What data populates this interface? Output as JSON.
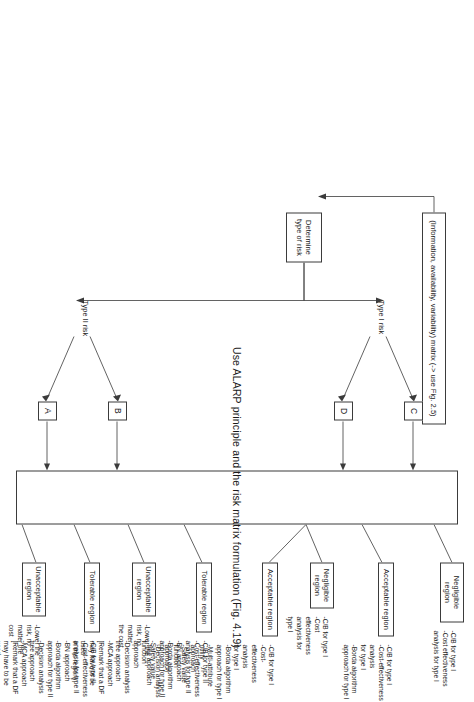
{
  "figure": {
    "caption_left": "",
    "orientation": "rotated-90"
  },
  "diagram": {
    "title": "Use ALARP principle and the risk matrix formulation (Fig. 4.19)",
    "top_input": "(Information, availability, variability) matrix (-> use Fig. 2.5)",
    "determine": "Determine\ntype of risk",
    "branch_labels": {
      "type1": "Type I risk",
      "type2": "Type II risk"
    },
    "nodes": [
      {
        "id": "A",
        "label": "A"
      },
      {
        "id": "B",
        "label": "B"
      },
      {
        "id": "C",
        "label": "C"
      },
      {
        "id": "D",
        "label": "D"
      }
    ],
    "regions": [
      {
        "key": "unacceptable-2",
        "header": "Unacceptable\nregion",
        "items": "-Lower the\nrisk, no\nmatter the\ncost"
      },
      {
        "key": "tolerable-2",
        "header": "Tolerable region",
        "items": "-C/B for type II\n-Cost-effectiveness\nanalysis for type II\n-BN approach\n-Borda algorithm\napproach for type II\n-Decision analysis\ntree approach\n-MCA approach\n[Remark that a DF\nmay have to be used\nin this region]"
      },
      {
        "key": "unacceptable-1",
        "header": "Unacceptable\nregion",
        "items": "-Lower the\nrisk, no\nmatter\nthe cost"
      },
      {
        "key": "tolerable-1",
        "header": "Tolerable region",
        "items": "-C/B for type II\n-Cost-effectiveness\nanalysis for type II\n-BN approach\n-Borda algorithm\napproach for type II\n-Safety value function\napproach\n-Decision analysis\ntree approach\n-MCA approach\n[Remark that a DF\nmay have to be used\nin this region]"
      },
      {
        "key": "acceptable-1",
        "header": "Acceptable region",
        "items": "-C/B for type I\n-Cost-effectiveness\nanalysis\nfor type I\n-Borda algorithm\napproach for type I\n-Multi-attribute utility\napproach\n-Safety value function\napproach\n-Decision analysis\ntree approach"
      },
      {
        "key": "negligible-1",
        "header": "Negligible\nregion",
        "items": "-C/B for type I\n-Cost\neffectiveness\nanalysis for\ntype I"
      },
      {
        "key": "acceptable-2",
        "header": "Acceptable region",
        "items": "-C/B for type I\n-Cost-effectiveness\nanalysis\nfor type I\n-Borda algorithm\napproach for type I"
      },
      {
        "key": "negligible-2",
        "header": "Negligible\nregion",
        "items": "-C/B for type I\n-Cost effectiveness\nanalysis for type I"
      }
    ]
  }
}
